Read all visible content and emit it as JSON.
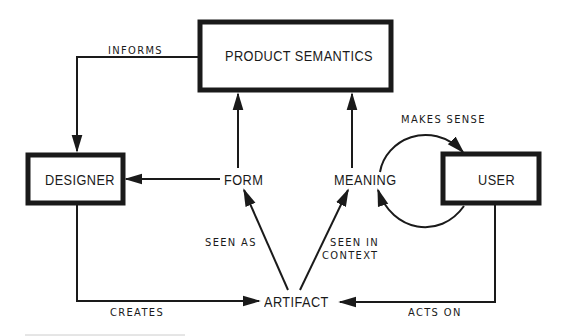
{
  "diagram": {
    "nodes": {
      "product_semantics": "PRODUCT SEMANTICS",
      "designer": "DESIGNER",
      "user": "USER",
      "form": "FORM",
      "meaning": "MEANING",
      "artifact": "ARTIFACT"
    },
    "edges": {
      "informs": "INFORMS",
      "makes_sense": "MAKES SENSE",
      "seen_as": "SEEN AS",
      "seen_in_context_1": "SEEN IN",
      "seen_in_context_2": "CONTEXT",
      "creates": "CREATES",
      "acts_on": "ACTS ON"
    },
    "colors": {
      "ink": "#1a1a1a",
      "background": "#ffffff"
    }
  }
}
